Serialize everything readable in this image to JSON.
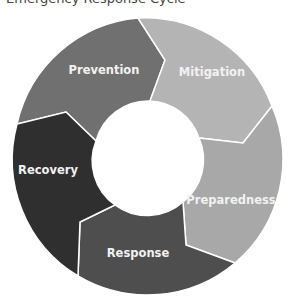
{
  "title": "Emergency Response Cycle",
  "diagram": {
    "type": "cycle",
    "segments": [
      {
        "label": "Prevention",
        "color": "#707070"
      },
      {
        "label": "Mitigation",
        "color": "#b4b4b4"
      },
      {
        "label": "Preparedness",
        "color": "#a8a8a8"
      },
      {
        "label": "Response",
        "color": "#4e4e4e"
      },
      {
        "label": "Recovery",
        "color": "#2f2f2f"
      }
    ]
  }
}
